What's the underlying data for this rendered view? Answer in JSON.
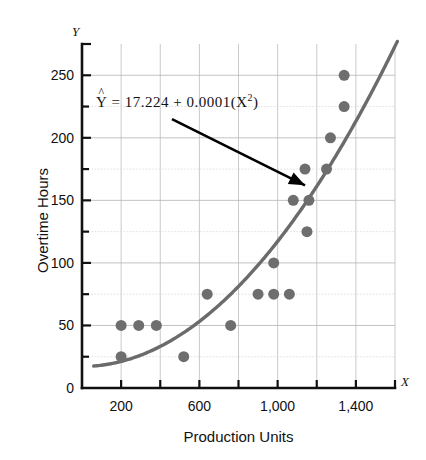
{
  "chart_data": {
    "type": "scatter",
    "title": "",
    "xlabel": "Production Units",
    "ylabel": "Overtime Hours",
    "x_axis_symbol": "X",
    "y_axis_symbol": "Y",
    "xlim": [
      0,
      1600
    ],
    "ylim": [
      0,
      275
    ],
    "x_major_ticks": [
      200,
      600,
      1000,
      1400
    ],
    "x_minor_ticks": [
      400,
      800,
      1200,
      1600
    ],
    "x_tick_labels": [
      "200",
      "600",
      "1,000",
      "1,400"
    ],
    "y_major_ticks": [
      0,
      50,
      100,
      150,
      200,
      250
    ],
    "y_minor_ticks": [
      25,
      75,
      125,
      175,
      225
    ],
    "y_tick_labels": [
      "0",
      "50",
      "100",
      "150",
      "200",
      "250"
    ],
    "grid": true,
    "grid_x_step": 200,
    "grid_y_step": 25,
    "legend": "none",
    "annotation": {
      "text_parts": {
        "yhat": "Y",
        "body": " =  17.224  +  0.0001(X",
        "exponent": "2",
        "tail": ")"
      },
      "full_text": "Ŷ = 17.224 + 0.0001(X²)",
      "arrow_from": [
        460,
        215
      ],
      "arrow_to": [
        1140,
        162
      ]
    },
    "fit_curve": {
      "kind": "quadratic",
      "intercept": 17.224,
      "quadratic_coefficient": 0.0001,
      "linear_coefficient": 0,
      "color": "#6b6b6b",
      "x_start": 60,
      "x_end": 1620
    },
    "points": [
      {
        "x": 200,
        "y": 50
      },
      {
        "x": 200,
        "y": 25
      },
      {
        "x": 290,
        "y": 50
      },
      {
        "x": 380,
        "y": 50
      },
      {
        "x": 520,
        "y": 25
      },
      {
        "x": 640,
        "y": 75
      },
      {
        "x": 760,
        "y": 50
      },
      {
        "x": 900,
        "y": 75
      },
      {
        "x": 980,
        "y": 75
      },
      {
        "x": 980,
        "y": 100
      },
      {
        "x": 1060,
        "y": 75
      },
      {
        "x": 1080,
        "y": 150
      },
      {
        "x": 1160,
        "y": 150
      },
      {
        "x": 1150,
        "y": 125
      },
      {
        "x": 1140,
        "y": 175
      },
      {
        "x": 1250,
        "y": 175
      },
      {
        "x": 1270,
        "y": 200
      },
      {
        "x": 1340,
        "y": 225
      },
      {
        "x": 1340,
        "y": 250
      }
    ],
    "point_color": "#6e6e6e",
    "point_radius": 5.5
  }
}
